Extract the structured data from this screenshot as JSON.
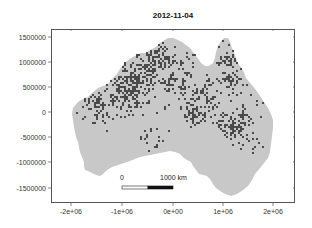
{
  "chart_data": {
    "type": "heatmap",
    "title": "2012-11-04",
    "xlabel": "",
    "ylabel": "",
    "x_ticks": [
      -2000000,
      -1000000,
      0,
      1000000,
      2000000
    ],
    "x_tick_labels": [
      "-2e+06",
      "-1e+06",
      "0e+00",
      "1e+06",
      "2e+06"
    ],
    "y_ticks": [
      1500000,
      1000000,
      500000,
      0,
      -500000,
      -1000000,
      -1500000
    ],
    "y_tick_labels": [
      "1500000",
      "1000000",
      "500000",
      "0",
      "-500000",
      "-1000000",
      "-1500000"
    ],
    "xlim": [
      -2400000,
      2420000
    ],
    "ylim": [
      -1820000,
      1670000
    ],
    "grid": false,
    "legend": "none",
    "region": "Australia (projected coordinates)",
    "classes": [
      {
        "name": "background",
        "color": "#c8c8c8"
      },
      {
        "name": "highlighted",
        "color": "#4a4a4a"
      }
    ],
    "scale_bar": {
      "start_label": "0",
      "end_label": "1000 km",
      "length_m": 1000000
    }
  },
  "colors": {
    "land": "#c8c8c8",
    "dark": "#4a4a4a",
    "frame": "#555555"
  }
}
